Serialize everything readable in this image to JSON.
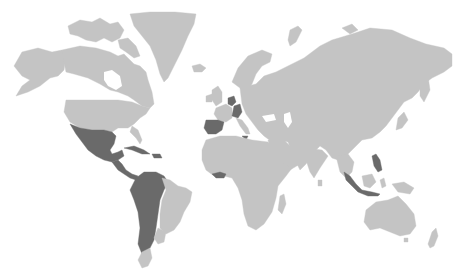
{
  "map": {
    "type": "world-choropleth",
    "projection": "mercator",
    "colors": {
      "background": "#ffffff",
      "base_land": "#c4c4c4",
      "highlighted": "#6a6a6a"
    },
    "highlighted_regions": [
      "Mexico",
      "Guatemala",
      "Honduras",
      "El Salvador",
      "Nicaragua",
      "Costa Rica",
      "Panama",
      "Cuba",
      "Dominican Republic",
      "Colombia",
      "Venezuela",
      "Ecuador",
      "Peru",
      "Bolivia",
      "Chile",
      "Argentina",
      "Spain",
      "Belgium",
      "Netherlands",
      "Switzerland",
      "Italy (Sicily)",
      "Ghana",
      "Togo",
      "Philippines",
      "Indonesia (Sumatra/Java)"
    ],
    "labels": []
  }
}
